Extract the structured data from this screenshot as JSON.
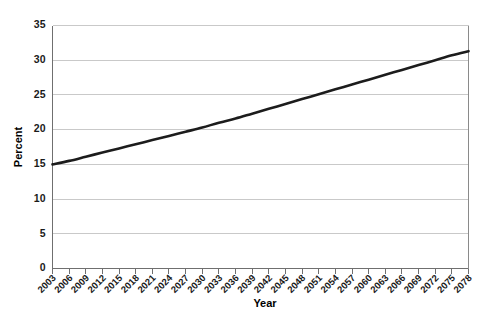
{
  "chart_data": {
    "type": "line",
    "title": "",
    "subtitle": "",
    "xlabel": "Year",
    "ylabel": "Percent",
    "xlim": [
      2003,
      2078
    ],
    "ylim": [
      0,
      35
    ],
    "grid": "horizontal",
    "legend": "none",
    "y_ticks": [
      0,
      5,
      10,
      15,
      20,
      25,
      30,
      35
    ],
    "y_tick_labels": [
      "0",
      "5",
      "10",
      "15",
      "20",
      "25",
      "30",
      "35"
    ],
    "x": [
      2003,
      2006,
      2009,
      2012,
      2015,
      2018,
      2021,
      2024,
      2027,
      2030,
      2033,
      2036,
      2039,
      2042,
      2045,
      2048,
      2051,
      2054,
      2057,
      2060,
      2063,
      2066,
      2069,
      2072,
      2075,
      2078
    ],
    "x_tick_labels": [
      "2003",
      "2006",
      "2009",
      "2012",
      "2015",
      "2018",
      "2021",
      "2024",
      "2027",
      "2030",
      "2033",
      "2036",
      "2039",
      "2042",
      "2045",
      "2048",
      "2051",
      "2054",
      "2057",
      "2060",
      "2063",
      "2066",
      "2069",
      "2072",
      "2075",
      "2078"
    ],
    "series": [
      {
        "name": "Percent",
        "color": "#1c1c1c",
        "values": [
          15.0,
          15.5,
          16.1,
          16.7,
          17.3,
          17.9,
          18.5,
          19.1,
          19.7,
          20.3,
          21.0,
          21.6,
          22.3,
          23.0,
          23.7,
          24.4,
          25.1,
          25.8,
          26.5,
          27.2,
          27.9,
          28.6,
          29.3,
          30.0,
          30.7,
          31.3
        ]
      }
    ],
    "colors": {
      "line": "#1c1c1c",
      "grid": "#c9c9c9",
      "axis": "#6f6f6f",
      "background": "#ffffff",
      "text": "#1a1a1a"
    }
  }
}
